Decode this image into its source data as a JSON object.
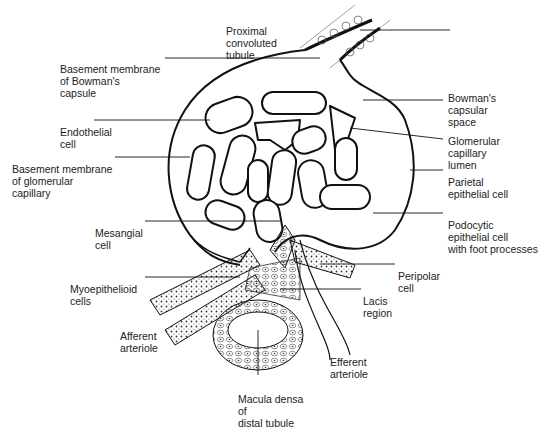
{
  "diagram": {
    "labels": {
      "proximal_tubule": [
        "Proximal",
        "convoluted",
        "tubule"
      ],
      "bm_bowman": [
        "Basement membrane",
        "of Bowman's",
        "capsule"
      ],
      "endothelial": [
        "Endothelial",
        "cell"
      ],
      "bm_glomerular": [
        "Basement membrane",
        "of glomerular",
        "capillary"
      ],
      "mesangial": [
        "Mesangial",
        "cell"
      ],
      "myoepithelioid": [
        "Myoepithelioid",
        "cells"
      ],
      "afferent": [
        "Afferent",
        "arteriole"
      ],
      "macula_densa": [
        "Macula densa",
        "of",
        "distal tubule"
      ],
      "bowman_space": [
        "Bowman's",
        "capsular",
        "space"
      ],
      "capillary_lumen": [
        "Glomerular",
        "capillary",
        "lumen"
      ],
      "parietal": [
        "Parietal",
        "epithelial cell"
      ],
      "podocyte": [
        "Podocytic",
        "epithelial cell",
        "with foot processes"
      ],
      "peripolar": [
        "Peripolar",
        "cell"
      ],
      "lacis": [
        "Lacis",
        "region"
      ],
      "efferent": [
        "Efferent",
        "arteriole"
      ]
    },
    "colors": {
      "ink": "#1a1a1a",
      "background": "#ffffff",
      "stipple": "#555555"
    }
  }
}
